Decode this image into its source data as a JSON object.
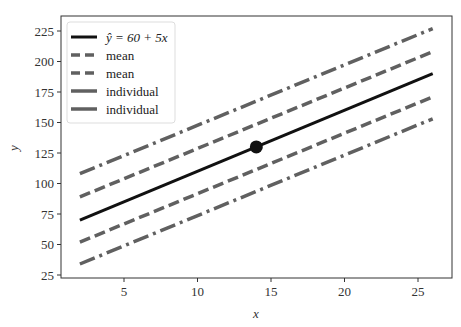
{
  "chart_data": {
    "type": "line",
    "title": "",
    "xlabel": "x",
    "ylabel": "y",
    "xlim": [
      1,
      27
    ],
    "ylim": [
      24,
      237
    ],
    "xticks": [
      5,
      10,
      15,
      20,
      25
    ],
    "yticks": [
      25,
      50,
      75,
      100,
      125,
      150,
      175,
      200,
      225
    ],
    "grid": false,
    "legend_position": "upper left",
    "x": [
      2,
      26
    ],
    "series": [
      {
        "name": "ŷ = 60 + 5x",
        "style": "solid",
        "color": "#111111",
        "values": [
          70,
          190
        ]
      },
      {
        "name": "mean",
        "style": "dashed",
        "color": "#606060",
        "values": [
          89,
          208
        ]
      },
      {
        "name": "mean",
        "style": "dashed",
        "color": "#606060",
        "values": [
          52,
          171
        ]
      },
      {
        "name": "individual",
        "style": "dashdot",
        "color": "#606060",
        "values": [
          108,
          227
        ]
      },
      {
        "name": "individual",
        "style": "dashdot",
        "color": "#606060",
        "values": [
          34,
          153
        ]
      }
    ],
    "points": [
      {
        "x": 14,
        "y": 130,
        "label": "mean point"
      }
    ]
  },
  "legend": {
    "items": [
      {
        "label": "ŷ = 60 + 5x"
      },
      {
        "label": "mean"
      },
      {
        "label": "mean"
      },
      {
        "label": "individual"
      },
      {
        "label": "individual"
      }
    ]
  },
  "axes": {
    "xlabel": "x",
    "ylabel": "y"
  }
}
